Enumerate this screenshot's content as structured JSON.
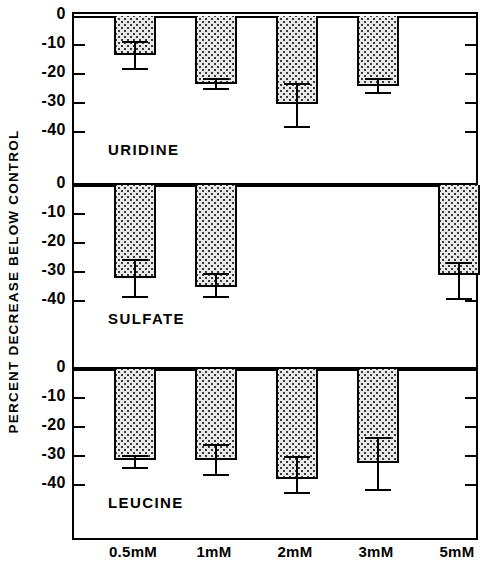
{
  "chart_data": {
    "type": "bar",
    "title": "",
    "xlabel": "",
    "ylabel": "PERCENT DECREASE BELOW CONTROL",
    "categories": [
      "0.5mM",
      "1mM",
      "2mM",
      "3mM",
      "5mM"
    ],
    "ylim": [
      -45,
      0
    ],
    "ytick_values": [
      0,
      -10,
      -20,
      -30,
      -40
    ],
    "ytick_labels": [
      "0",
      "-10",
      "-20",
      "-30",
      "-40"
    ],
    "grid": false,
    "legend": "none",
    "orientation": "downward-bars-from-zero-baseline",
    "panels": [
      {
        "name": "URIDINE",
        "categories": [
          "0.5mM",
          "1mM",
          "2mM",
          "3mM",
          "5mM"
        ],
        "values": [
          -13.5,
          -23.5,
          -30.5,
          -24.0,
          null
        ],
        "errors_low": [
          -18.5,
          -25.5,
          -38.5,
          -27.0,
          null
        ],
        "errors_high": [
          -8.5,
          -21.5,
          -23.0,
          -21.5,
          null
        ]
      },
      {
        "name": "SULFATE",
        "categories": [
          "0.5mM",
          "1mM",
          "2mM",
          "3mM",
          "5mM"
        ],
        "values": [
          -32.0,
          -35.0,
          null,
          null,
          -31.0
        ],
        "errors_low": [
          -39.0,
          -39.0,
          null,
          null,
          -39.5
        ],
        "errors_high": [
          -25.5,
          -30.5,
          null,
          null,
          -26.5
        ]
      },
      {
        "name": "LEUCINE",
        "categories": [
          "0.5mM",
          "1mM",
          "2mM",
          "3mM",
          "5mM"
        ],
        "values": [
          -31.5,
          -31.5,
          -38.0,
          -32.5,
          null
        ],
        "errors_low": [
          -34.5,
          -37.0,
          -43.0,
          -42.0,
          null
        ],
        "errors_high": [
          -29.5,
          -26.0,
          -30.0,
          -23.5,
          null
        ]
      }
    ]
  },
  "axis": {
    "y_title": "PERCENT DECREASE BELOW CONTROL",
    "y_ticks": [
      "0",
      "-10",
      "-20",
      "-30",
      "-40"
    ],
    "x_ticks": [
      "0.5mM",
      "1mM",
      "2mM",
      "3mM",
      "5mM"
    ]
  },
  "panel_names": {
    "uridine": "URIDINE",
    "sulfate": "SULFATE",
    "leucine": "LEUCINE"
  },
  "style": {
    "bar_fill": "#e9e9e9",
    "bar_stroke": "#000000",
    "axis_color": "#000000",
    "background": "#ffffff"
  }
}
